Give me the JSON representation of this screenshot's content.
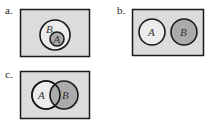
{
  "panels": [
    {
      "label": "a.",
      "description": "A is a subset of B",
      "circles": [
        {
          "name": "B",
          "shaded": false
        },
        {
          "name": "A",
          "shaded": true
        }
      ]
    },
    {
      "label": "b.",
      "description": "A and B are disjoint",
      "circles": [
        {
          "name": "A",
          "shaded": false
        },
        {
          "name": "B",
          "shaded": true
        }
      ]
    },
    {
      "label": "c.",
      "description": "A and B overlap",
      "circles": [
        {
          "name": "A",
          "shaded": false
        },
        {
          "name": "B",
          "shaded": true
        }
      ]
    }
  ],
  "colors": {
    "universe": "#dcdcdc",
    "unshaded": "#ececec",
    "shaded": "#ababab",
    "stroke": "#1a1a1a"
  }
}
